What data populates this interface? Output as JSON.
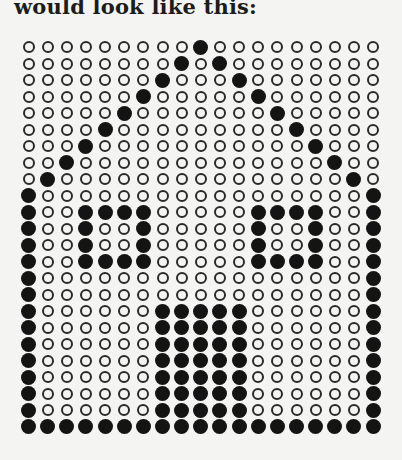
{
  "caption": "would look like this:",
  "figure": {
    "type": "dot-matrix",
    "columns": 19,
    "rows": 24,
    "legend": {
      "filled": "dark dot",
      "empty": "hollow ring"
    },
    "colors": {
      "filled": "#141414",
      "ring": "#2a2a2a",
      "paper": "#f4f4f2"
    },
    "pattern": [
      "0000000001000000000",
      "0000000010100000000",
      "0000000100010000000",
      "0000001000001000000",
      "0000010000000100000",
      "0000100000000010000",
      "0001000000000001000",
      "0010000000000000100",
      "0100000000000000010",
      "1000000000000000001",
      "1001111000001111001",
      "1001001000001001001",
      "1001001000001001001",
      "1001111000001111001",
      "1000000000000000001",
      "1000000000000000001",
      "1000000111110000001",
      "1000000111110000001",
      "1000000111110000001",
      "1000000111110000001",
      "1000000111110000001",
      "1000000111110000001",
      "1000000111110000001",
      "1111111111111111111"
    ]
  }
}
